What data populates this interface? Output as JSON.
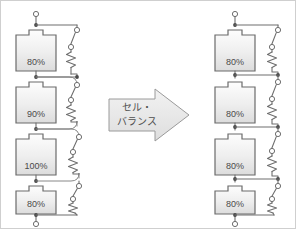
{
  "diagram": {
    "colors": {
      "wire": "#6e6e6e",
      "cell_outline": "#6b6b6b",
      "cell_fill_top": "#fcfcfc",
      "cell_fill_bottom": "#dcdcdc",
      "label_text": "#4a4a4a",
      "arrow_fill": "#e8e8e8",
      "arrow_outline": "#9a9a9a",
      "background": "#ffffff",
      "border": "#cfcfcf"
    }
  },
  "left_stack": {
    "name": "unbalanced-battery-stack",
    "cells": [
      {
        "id": "left-cell-1",
        "label": "80%",
        "soc": 80
      },
      {
        "id": "left-cell-2",
        "label": "90%",
        "soc": 90
      },
      {
        "id": "left-cell-3",
        "label": "100%",
        "soc": 100
      },
      {
        "id": "left-cell-4",
        "label": "80%",
        "soc": 80
      }
    ],
    "balancing_branches": 4,
    "branch_components": [
      "switch",
      "resistor"
    ]
  },
  "right_stack": {
    "name": "balanced-battery-stack",
    "cells": [
      {
        "id": "right-cell-1",
        "label": "80%",
        "soc": 80
      },
      {
        "id": "right-cell-2",
        "label": "80%",
        "soc": 80
      },
      {
        "id": "right-cell-3",
        "label": "80%",
        "soc": 80
      },
      {
        "id": "right-cell-4",
        "label": "80%",
        "soc": 80
      }
    ],
    "balancing_branches": 4,
    "branch_components": [
      "switch",
      "resistor"
    ]
  },
  "arrow": {
    "name": "cell-balance-arrow",
    "line1": "セル・",
    "line2": "バランス",
    "direction": "right"
  }
}
